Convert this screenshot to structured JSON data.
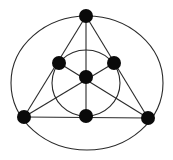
{
  "diagram": {
    "type": "fano-plane",
    "width": 173,
    "height": 160,
    "colors": {
      "background": "#ffffff",
      "line": "#2a2a2a",
      "node": "#0a0a0a"
    },
    "node_radius": 7,
    "nodes": [
      {
        "id": "top",
        "x": 86,
        "y": 16
      },
      {
        "id": "mid-left",
        "x": 59,
        "y": 63
      },
      {
        "id": "mid-right",
        "x": 114,
        "y": 63
      },
      {
        "id": "center",
        "x": 86,
        "y": 77
      },
      {
        "id": "bottom-left",
        "x": 24,
        "y": 117
      },
      {
        "id": "bottom-middle",
        "x": 86,
        "y": 116
      },
      {
        "id": "bottom-right",
        "x": 148,
        "y": 118
      }
    ],
    "lines": [
      {
        "from": "top",
        "to": "bottom-left"
      },
      {
        "from": "top",
        "to": "bottom-right"
      },
      {
        "from": "bottom-left",
        "to": "bottom-right"
      },
      {
        "from": "top",
        "to": "bottom-middle"
      },
      {
        "from": "bottom-left",
        "to": "mid-right"
      },
      {
        "from": "bottom-right",
        "to": "mid-left"
      }
    ],
    "curves": [
      {
        "id": "outer-circle",
        "cx": 87,
        "cy": 83,
        "rx": 76,
        "ry": 67
      },
      {
        "id": "inner-circle",
        "cx": 86,
        "cy": 83,
        "rx": 34,
        "ry": 33
      }
    ]
  }
}
